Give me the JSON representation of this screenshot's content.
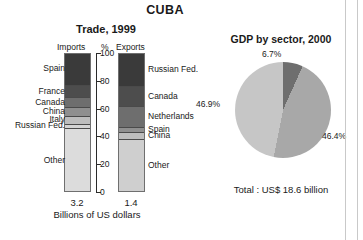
{
  "header": {
    "title": "CUBA"
  },
  "trade": {
    "title": "Trade, 1999",
    "headers": {
      "imports": "Imports",
      "percent": "%",
      "exports": "Exports"
    },
    "axis_caption": "Billions of US dollars",
    "axis_ticks": [
      "100",
      "80",
      "60",
      "40",
      "20",
      "0"
    ],
    "imports_value": "3.2",
    "exports_value": "1.4"
  },
  "gdp": {
    "title": "GDP by sector, 2000",
    "total": "Total : US$ 18.6 billion"
  },
  "colors": {
    "darkest": "#3a3a3a",
    "dark": "#4d4d4d",
    "mid_dark": "#6e6e6e",
    "mid": "#8f8f8f",
    "light": "#bdbdbd",
    "lighter": "#d3d3d3",
    "lightest": "#dcdcdc",
    "axis": "#2b2b2b",
    "outline": "#6f6f6f"
  },
  "chart_data": [
    {
      "type": "bar",
      "title": "Trade, 1999 — Imports",
      "subtitle": "Imports",
      "xlabel": "Billions of US dollars",
      "ylabel": "%",
      "ylim": [
        0,
        100
      ],
      "grid": false,
      "total_label": "3.2",
      "stacked": true,
      "categories": [
        "Spain",
        "France",
        "Canada",
        "China",
        "Italy",
        "Russian Fed.",
        "Other"
      ],
      "values": [
        23.0,
        9.0,
        7.0,
        6.0,
        6.0,
        3.0,
        46.0
      ],
      "cumulative_top": [
        100,
        77,
        68,
        61,
        55,
        49,
        46
      ],
      "colors": [
        "#3a3a3a",
        "#4d4d4d",
        "#6e6e6e",
        "#8f8f8f",
        "#bdbdbd",
        "#d3d3d3",
        "#dcdcdc"
      ]
    },
    {
      "type": "bar",
      "title": "Trade, 1999 — Exports",
      "subtitle": "Exports",
      "xlabel": "Billions of US dollars",
      "ylabel": "%",
      "ylim": [
        0,
        100
      ],
      "grid": false,
      "total_label": "1.4",
      "stacked": true,
      "categories": [
        "Russian Fed.",
        "Canada",
        "Netherlands",
        "Spain",
        "China",
        "Other"
      ],
      "values": [
        24.0,
        14.0,
        15.0,
        4.0,
        5.0,
        38.0
      ],
      "cumulative_top": [
        100,
        76,
        62,
        47,
        43,
        38
      ],
      "colors": [
        "#3a3a3a",
        "#4d4d4d",
        "#6e6e6e",
        "#8f8f8f",
        "#bdbdbd",
        "#cfcfcf"
      ]
    },
    {
      "type": "pie",
      "title": "GDP by sector, 2000",
      "annotation": "Total : US$ 18.6 billion",
      "labels": [
        "6.7%",
        "46.4%",
        "46.9%"
      ],
      "values": [
        6.7,
        46.4,
        46.9
      ],
      "colors": [
        "#6e6e6e",
        "#a8a8a8",
        "#c6c6c6"
      ],
      "legend": "none"
    }
  ]
}
